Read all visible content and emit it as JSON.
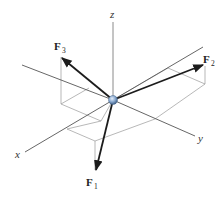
{
  "diagram": {
    "type": "3D force vectors at a point",
    "axes": {
      "x": {
        "label": "x"
      },
      "y": {
        "label": "y"
      },
      "z": {
        "label": "z"
      }
    },
    "forces": [
      {
        "name": "F",
        "subscript": "1",
        "direction": "down, slightly toward x"
      },
      {
        "name": "F",
        "subscript": "2",
        "direction": "up toward +y, slightly -x"
      },
      {
        "name": "F",
        "subscript": "3",
        "direction": "up toward -y, +x side"
      }
    ],
    "colors": {
      "axis": "#555555",
      "force": "#1c1c1c",
      "construction_box": "#9a9a9a",
      "particle": "#8aa9cf"
    }
  }
}
